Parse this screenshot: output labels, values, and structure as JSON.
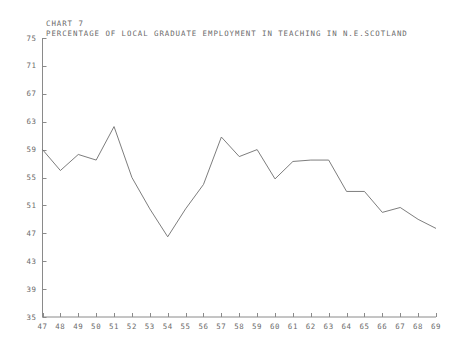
{
  "header": {
    "chart_number_line": "CHART  7",
    "title": "PERCENTAGE OF LOCAL GRADUATE EMPLOYMENT IN TEACHING IN N.E.SCOTLAND"
  },
  "style": {
    "line_color": "#6e6e6e",
    "axis_color": "#8a8a8a",
    "text_color": "#6b6b6b",
    "background": "#ffffff"
  },
  "axis": {
    "y_ticks": [
      "75",
      "71",
      "67",
      "63",
      "59",
      "55",
      "51",
      "47",
      "43",
      "39",
      "35"
    ],
    "x_ticks": [
      "47",
      "48",
      "49",
      "50",
      "51",
      "52",
      "53",
      "54",
      "55",
      "56",
      "57",
      "58",
      "59",
      "60",
      "61",
      "62",
      "63",
      "64",
      "65",
      "66",
      "67",
      "68",
      "69"
    ]
  },
  "chart_data": {
    "type": "line",
    "title": "PERCENTAGE OF LOCAL GRADUATE EMPLOYMENT IN TEACHING IN N.E.SCOTLAND",
    "subtitle": "CHART  7",
    "xlabel": "",
    "ylabel": "",
    "x": [
      47,
      48,
      49,
      50,
      51,
      52,
      53,
      54,
      55,
      56,
      57,
      58,
      59,
      60,
      61,
      62,
      63,
      64,
      65,
      66,
      67,
      68,
      69
    ],
    "categories": [
      "47",
      "48",
      "49",
      "50",
      "51",
      "52",
      "53",
      "54",
      "55",
      "56",
      "57",
      "58",
      "59",
      "60",
      "61",
      "62",
      "63",
      "64",
      "65",
      "66",
      "67",
      "68",
      "69"
    ],
    "values": [
      59.0,
      56.0,
      58.3,
      57.5,
      62.3,
      55.0,
      50.5,
      46.5,
      50.5,
      54.0,
      60.8,
      58.0,
      59.0,
      54.8,
      57.3,
      57.5,
      57.5,
      53.0,
      53.0,
      50.0,
      50.7,
      49.0,
      47.7
    ],
    "series": [
      {
        "name": "Percentage in teaching",
        "values": [
          59.0,
          56.0,
          58.3,
          57.5,
          62.3,
          55.0,
          50.5,
          46.5,
          50.5,
          54.0,
          60.8,
          58.0,
          59.0,
          54.8,
          57.3,
          57.5,
          57.5,
          53.0,
          53.0,
          50.0,
          50.7,
          49.0,
          47.7
        ]
      }
    ],
    "xlim": [
      47,
      69
    ],
    "ylim": [
      35,
      75
    ],
    "ytick_values": [
      75,
      71,
      67,
      63,
      59,
      55,
      51,
      47,
      43,
      39,
      35
    ],
    "xtick_values": [
      47,
      48,
      49,
      50,
      51,
      52,
      53,
      54,
      55,
      56,
      57,
      58,
      59,
      60,
      61,
      62,
      63,
      64,
      65,
      66,
      67,
      68,
      69
    ],
    "grid": false,
    "legend": null,
    "markers": false
  }
}
